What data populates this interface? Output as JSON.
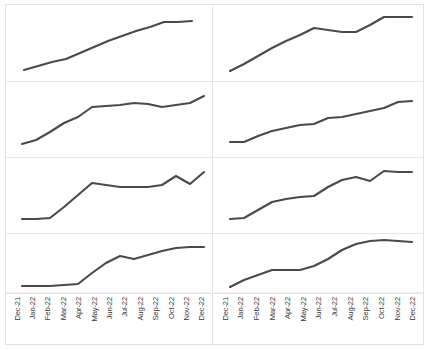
{
  "figure": {
    "title": "",
    "background_color": "#ffffff",
    "frame_color": "#e3e3e3",
    "grid_color": "#e6e6e6",
    "line_color": "#4a4a4a",
    "rows": 4,
    "columns": 2
  },
  "axis": {
    "tick_labels": [
      "Dec-21",
      "Jan-22",
      "Feb-22",
      "Mar-22",
      "Apr-22",
      "May-22",
      "Jun-22",
      "Jul-22",
      "Aug-22",
      "Sep-22",
      "Oct-22",
      "Nov-22",
      "Dec-22"
    ],
    "label_rotation_degrees": -90,
    "xlabel": "",
    "ylabel": ""
  },
  "chart_data": {
    "type": "line",
    "title": "",
    "subtitle": "",
    "xlabel": "",
    "ylabel": "",
    "grid": true,
    "legend_position": "none",
    "layout": "small-multiples 4 rows x 2 columns",
    "categories": [
      "Dec-21",
      "Jan-22",
      "Feb-22",
      "Mar-22",
      "Apr-22",
      "May-22",
      "Jun-22",
      "Jul-22",
      "Aug-22",
      "Sep-22",
      "Oct-22",
      "Nov-22",
      "Dec-22"
    ],
    "ylim": [
      0,
      100
    ],
    "panels": [
      {
        "position": "row1-col1",
        "name": "panel-1",
        "values": [
          17,
          23,
          29,
          33,
          42,
          51,
          59,
          66,
          73,
          79,
          86,
          86,
          87
        ]
      },
      {
        "position": "row1-col2",
        "name": "panel-2",
        "values": [
          14,
          25,
          36,
          47,
          57,
          66,
          76,
          74,
          71,
          71,
          81,
          92,
          92
        ]
      },
      {
        "position": "row2-col1",
        "name": "panel-3",
        "values": [
          12,
          20,
          32,
          45,
          54,
          69,
          70,
          71,
          74,
          73,
          69,
          72,
          76,
          86
        ]
      },
      {
        "position": "row2-col2",
        "name": "panel-4",
        "values": [
          18,
          18,
          26,
          33,
          38,
          41,
          43,
          50,
          51,
          55,
          59,
          63,
          71
        ]
      },
      {
        "position": "row3-col1",
        "name": "panel-5",
        "values": [
          11,
          11,
          12,
          26,
          44,
          62,
          59,
          57,
          57,
          57,
          60,
          71,
          62,
          77
        ]
      },
      {
        "position": "row3-col2",
        "name": "panel-6",
        "values": [
          11,
          12,
          22,
          33,
          38,
          40,
          41,
          54,
          63,
          67,
          62,
          77,
          76
        ]
      },
      {
        "position": "row4-col1",
        "name": "panel-7",
        "values": [
          5,
          5,
          5,
          7,
          9,
          26,
          43,
          55,
          49,
          57,
          64,
          69,
          72
        ]
      },
      {
        "position": "row4-col2",
        "name": "panel-8",
        "values": [
          4,
          14,
          22,
          30,
          30,
          31,
          39,
          51,
          66,
          79,
          86,
          88,
          85
        ]
      }
    ]
  }
}
